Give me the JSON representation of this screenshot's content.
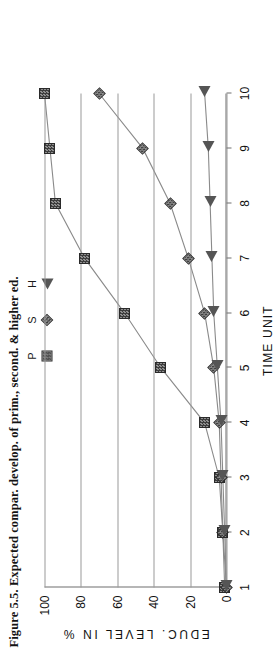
{
  "figure": {
    "caption": "Figure 5.5. Expected compar. develop. of prim., second. & higher ed."
  },
  "legend": {
    "position": "top-center",
    "items": [
      {
        "label": "P",
        "marker": "filled-square-marker"
      },
      {
        "label": "S",
        "marker": "filled-diamond-marker"
      },
      {
        "label": "H",
        "marker": "filled-triangle-marker"
      }
    ]
  },
  "axes": {
    "x_title": "TIME UNIT",
    "y_title": "EDUC. LEVEL IN %",
    "x_ticks": [
      "1",
      "2",
      "3",
      "4",
      "5",
      "6",
      "7",
      "8",
      "9",
      "10"
    ],
    "y_ticks": [
      "0",
      "20",
      "40",
      "60",
      "80",
      "100"
    ]
  },
  "chart_data": {
    "type": "line",
    "title": "Figure 5.5. Expected compar. develop. of prim., second. & higher ed.",
    "xlabel": "TIME UNIT",
    "ylabel": "EDUC. LEVEL IN %",
    "x": [
      1,
      2,
      3,
      4,
      5,
      6,
      7,
      8,
      9,
      10
    ],
    "xlim": [
      1,
      10
    ],
    "ylim": [
      0,
      100
    ],
    "grid": true,
    "legend_position": "top-center",
    "series": [
      {
        "name": "P",
        "marker": "square",
        "values": [
          1,
          2,
          4,
          12,
          36,
          56,
          78,
          94,
          97,
          100
        ]
      },
      {
        "name": "S",
        "marker": "diamond",
        "values": [
          0,
          2,
          3,
          4,
          7,
          12,
          21,
          31,
          46,
          70
        ]
      },
      {
        "name": "H",
        "marker": "triangle",
        "values": [
          0,
          1,
          2,
          3,
          5,
          7,
          8,
          9,
          10,
          12
        ]
      }
    ]
  }
}
